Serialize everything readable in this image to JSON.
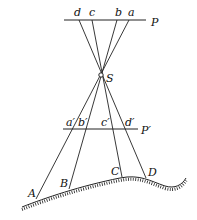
{
  "diagram": {
    "labels": {
      "P": "P",
      "P_prime": "P′",
      "S": "S",
      "d": "d",
      "c": "c",
      "b": "b",
      "a": "a",
      "a_prime": "a′",
      "b_prime": "b′",
      "c_prime": "c′",
      "d_prime": "d′",
      "A": "A",
      "B": "B",
      "C": "C",
      "D": "D"
    },
    "colors": {
      "stroke": "#222222",
      "text": "#111111",
      "background": "#ffffff"
    }
  }
}
